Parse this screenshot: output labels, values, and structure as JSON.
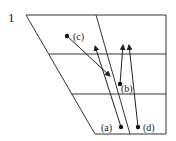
{
  "figure": {
    "number": "1",
    "colors": {
      "line": "#333333",
      "point": "#111111",
      "background": "#ffffff"
    },
    "outline": {
      "top_left": [
        26,
        15
      ],
      "top_right": [
        166,
        15
      ],
      "bottom_right": [
        166,
        134
      ],
      "bottom_left": [
        95,
        134
      ]
    },
    "divider": {
      "from": [
        96,
        15
      ],
      "to": [
        130,
        134
      ]
    },
    "horizontals": [
      {
        "y": 54,
        "x_start": 49,
        "x_end": 166
      },
      {
        "y": 94,
        "x_start": 72,
        "x_end": 166
      }
    ],
    "points": [
      {
        "id": "a",
        "label": "(a)",
        "pos": [
          121,
          127
        ],
        "arrow_to": [
          95,
          46
        ]
      },
      {
        "id": "b",
        "label": "(b)",
        "pos": [
          120,
          84
        ],
        "arrow_to": [
          123,
          45
        ]
      },
      {
        "id": "c",
        "label": "(c)",
        "pos": [
          67,
          36
        ],
        "arrow_to": [
          110,
          76
        ]
      },
      {
        "id": "d",
        "label": "(d)",
        "pos": [
          138,
          127
        ],
        "arrow_to": [
          129,
          45
        ]
      }
    ]
  }
}
